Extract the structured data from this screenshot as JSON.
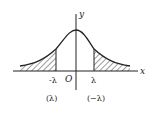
{
  "diagram": {
    "type": "normal-distribution-curve",
    "axes": {
      "x_label": "x",
      "y_label": "y",
      "origin_label": "O"
    },
    "markers": {
      "left": "-λ",
      "right": "λ"
    },
    "captions": {
      "left": "(λ)",
      "right": "(−λ)"
    },
    "shaded_regions": [
      "left tail (x < -λ)",
      "right tail (x > λ)"
    ],
    "colors": {
      "stroke": "#222222",
      "background": "#ffffff"
    }
  }
}
